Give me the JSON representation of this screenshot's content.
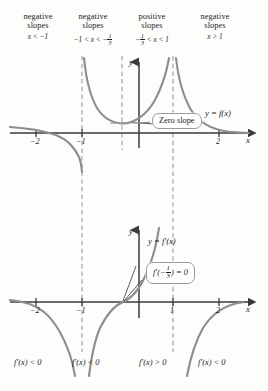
{
  "figure": {
    "background": "#fdfdfc",
    "curve_color": "#8a8a8a",
    "axis_color": "#3a3a3a",
    "dash_color": "#9d9d9d"
  },
  "regions": [
    {
      "word1": "negative",
      "word2": "slopes",
      "inequality": "x < −1",
      "left": 8,
      "width": 60
    },
    {
      "word1": "negative",
      "word2": "slopes",
      "inequality": "−1 < x < −",
      "frac": "1/3",
      "left": 62,
      "width": 62
    },
    {
      "word1": "positive",
      "word2": "slopes",
      "inequality": "−",
      "frac": "1/3",
      "inequality_tail": " < x < 1",
      "left": 122,
      "width": 60
    },
    {
      "word1": "negative",
      "word2": "slopes",
      "inequality": "x > 1",
      "left": 184,
      "width": 62
    }
  ],
  "upper_graph": {
    "curve_label": "y = f(x)",
    "callout": "Zero slope",
    "y_axis_label": "y",
    "x_axis_label": "x",
    "ticks": [
      {
        "label": "−2",
        "x": 36
      },
      {
        "label": "−1",
        "x": 82
      },
      {
        "label": "2",
        "x": 219
      }
    ]
  },
  "lower_graph": {
    "curve_label": "y = f′(x)",
    "callout_prefix": "f′(−",
    "callout_frac": "1/3",
    "callout_suffix": ") = 0",
    "y_axis_label": "y",
    "x_axis_label": "x",
    "ticks": [
      {
        "label": "−2",
        "x": 36
      },
      {
        "label": "−1",
        "x": 82
      },
      {
        "label": "1",
        "x": 173
      },
      {
        "label": "2",
        "x": 219
      }
    ]
  },
  "sign_labels": [
    {
      "text": "f′(x) < 0",
      "left": 14,
      "region": "x < -1"
    },
    {
      "text": "f′(x) < 0",
      "left": 72,
      "region": "-1 < x < -1/3"
    },
    {
      "text": "f′(x) > 0",
      "left": 139,
      "region": "-1/3 < x < 1"
    },
    {
      "text": "f′(x) < 0",
      "left": 198,
      "region": "x > 1"
    }
  ],
  "asymptotes": {
    "x_values": [
      -1,
      1
    ],
    "divider_at": -0.3333
  }
}
